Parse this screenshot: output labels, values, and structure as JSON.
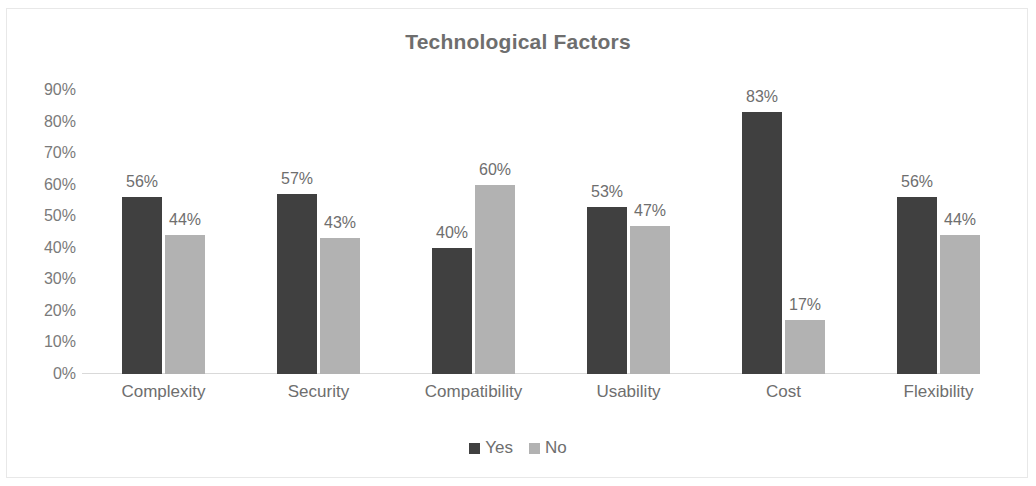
{
  "chart_data": {
    "type": "bar",
    "title": "Technological Factors",
    "xlabel": "",
    "ylabel": "",
    "ylim": [
      0,
      90
    ],
    "grid": false,
    "legend_position": "bottom",
    "y_ticks": [
      "0%",
      "10%",
      "20%",
      "30%",
      "40%",
      "50%",
      "60%",
      "70%",
      "80%",
      "90%"
    ],
    "y_tick_values": [
      0,
      10,
      20,
      30,
      40,
      50,
      60,
      70,
      80,
      90
    ],
    "categories": [
      "Complexity",
      "Security",
      "Compatibility",
      "Usability",
      "Cost",
      "Flexibility"
    ],
    "series": [
      {
        "name": "Yes",
        "color": "#404040",
        "values": [
          56,
          57,
          40,
          53,
          83,
          56
        ],
        "labels": [
          "56%",
          "57%",
          "40%",
          "53%",
          "83%",
          "56%"
        ]
      },
      {
        "name": "No",
        "color": "#b2b2b2",
        "values": [
          44,
          43,
          60,
          47,
          17,
          44
        ],
        "labels": [
          "44%",
          "43%",
          "60%",
          "47%",
          "17%",
          "44%"
        ]
      }
    ]
  },
  "colors": {
    "title_text": "#6e6e6e",
    "axis_text": "#7a7a7a",
    "axis_line": "#d9d9d9",
    "frame_border": "#e8e8e8",
    "background": "#ffffff",
    "series_yes": "#404040",
    "series_no": "#b2b2b2"
  }
}
